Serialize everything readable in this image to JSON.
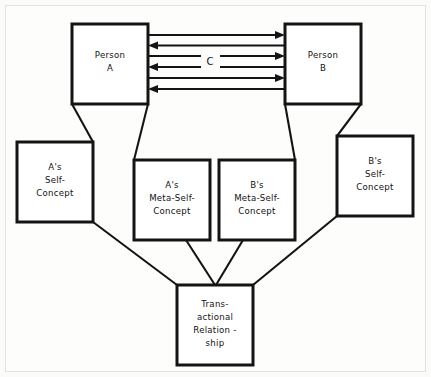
{
  "diagram": {
    "background_color": "#fbfbfa",
    "line_color": "#141414",
    "box_fill": "#ffffff",
    "nodes": [
      {
        "id": "person-a",
        "lines": [
          "Person",
          "A"
        ],
        "x": 72,
        "y": 24,
        "w": 76,
        "h": 80
      },
      {
        "id": "person-b",
        "lines": [
          "Person",
          "B"
        ],
        "x": 285,
        "y": 24,
        "w": 76,
        "h": 80
      },
      {
        "id": "a-self-concept",
        "lines": [
          "A's",
          "Self-",
          "Concept"
        ],
        "x": 17,
        "y": 142,
        "w": 76,
        "h": 80
      },
      {
        "id": "a-meta-self-concept",
        "lines": [
          "A's",
          "Meta-Self-",
          "Concept"
        ],
        "x": 134,
        "y": 160,
        "w": 76,
        "h": 80
      },
      {
        "id": "b-meta-self-concept",
        "lines": [
          "B's",
          "Meta-Self-",
          "Concept"
        ],
        "x": 219,
        "y": 160,
        "w": 76,
        "h": 80
      },
      {
        "id": "b-self-concept",
        "lines": [
          "B's",
          "Self-",
          "Concept"
        ],
        "x": 337,
        "y": 136,
        "w": 76,
        "h": 80
      },
      {
        "id": "transactional-relationship",
        "lines": [
          "Trans-",
          "actional",
          "Relation -",
          "ship"
        ],
        "x": 177,
        "y": 285,
        "w": 76,
        "h": 80
      }
    ],
    "channel": {
      "label": "C",
      "label_x": 210,
      "label_y": 61,
      "arrow_count": 6,
      "directions": [
        "right",
        "left",
        "right",
        "left",
        "right",
        "left"
      ],
      "y_positions": [
        35,
        45,
        56,
        67,
        78,
        89
      ]
    },
    "connections": [
      {
        "from": "person-a",
        "to": "a-self-concept"
      },
      {
        "from": "person-a",
        "to": "a-meta-self-concept"
      },
      {
        "from": "person-b",
        "to": "b-meta-self-concept"
      },
      {
        "from": "person-b",
        "to": "b-self-concept"
      },
      {
        "from": "a-self-concept",
        "to": "transactional-relationship"
      },
      {
        "from": "a-meta-self-concept",
        "to": "transactional-relationship"
      },
      {
        "from": "b-meta-self-concept",
        "to": "transactional-relationship"
      },
      {
        "from": "b-self-concept",
        "to": "transactional-relationship"
      }
    ]
  }
}
